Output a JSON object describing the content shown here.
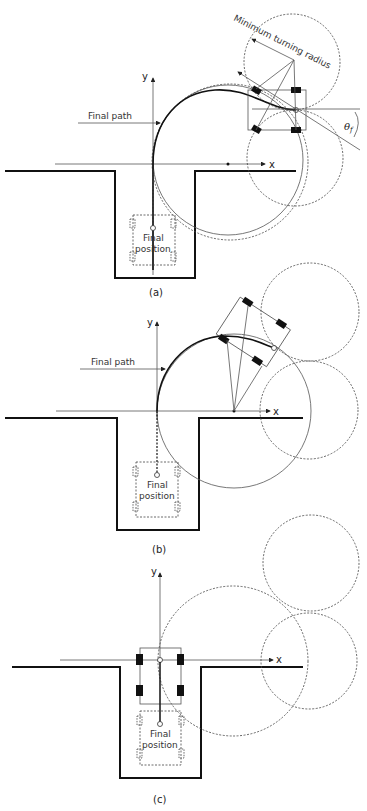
{
  "figure": {
    "panels": [
      {
        "caption": "(a)",
        "axis_x": "x",
        "axis_y": "y",
        "final_path_label": "Final path",
        "final_position_line1": "Final",
        "final_position_line2": "position",
        "min_turning_radius_label": "Minimum turning radius",
        "angle_label": "θ",
        "angle_subscript": "f"
      },
      {
        "caption": "(b)",
        "axis_x": "x",
        "axis_y": "y",
        "final_path_label": "Final path",
        "final_position_line1": "Final",
        "final_position_line2": "position"
      },
      {
        "caption": "(c)",
        "axis_x": "x",
        "axis_y": "y",
        "final_position_line1": "Final",
        "final_position_line2": "position"
      }
    ]
  }
}
